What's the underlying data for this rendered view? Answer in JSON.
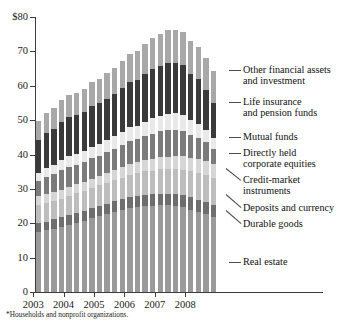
{
  "chart_data": {
    "type": "bar",
    "stacked": true,
    "title": "",
    "subtitle": "",
    "xlabel": "",
    "ylabel": "",
    "ylim": [
      0,
      80
    ],
    "yticks": [
      "$80",
      "70",
      "60",
      "50",
      "40",
      "30",
      "20",
      "10",
      "0"
    ],
    "ytick_values": [
      80,
      70,
      60,
      50,
      40,
      30,
      20,
      10,
      0
    ],
    "grid": false,
    "legend_position": "right-leader-lines",
    "xticks": [
      "2003",
      "2004",
      "2005",
      "2006",
      "2007",
      "2008"
    ],
    "xtick_values": [
      2003,
      2004,
      2005,
      2006,
      2007,
      2008
    ],
    "categories": [
      "2003:Q1",
      "2003:Q2",
      "2003:Q3",
      "2003:Q4",
      "2004:Q1",
      "2004:Q2",
      "2004:Q3",
      "2004:Q4",
      "2005:Q1",
      "2005:Q2",
      "2005:Q3",
      "2005:Q4",
      "2006:Q1",
      "2006:Q2",
      "2006:Q3",
      "2006:Q4",
      "2007:Q1",
      "2007:Q2",
      "2007:Q3",
      "2007:Q4",
      "2008:Q1",
      "2008:Q2",
      "2008:Q3",
      "2008:Q4"
    ],
    "series": [
      {
        "name": "Real estate",
        "color": "#9a9a9a",
        "values": [
          17.4,
          17.9,
          18.4,
          19.0,
          19.6,
          20.2,
          20.8,
          21.4,
          22.0,
          22.7,
          23.3,
          23.9,
          24.4,
          24.8,
          25.0,
          25.1,
          25.2,
          25.2,
          25.0,
          24.6,
          24.0,
          23.3,
          22.6,
          21.8
        ]
      },
      {
        "name": "Durable goods",
        "color": "#6e6e6e",
        "values": [
          2.6,
          2.6,
          2.7,
          2.7,
          2.8,
          2.8,
          2.9,
          2.9,
          3.0,
          3.0,
          3.1,
          3.1,
          3.2,
          3.2,
          3.3,
          3.3,
          3.4,
          3.4,
          3.5,
          3.5,
          3.5,
          3.5,
          3.5,
          3.4
        ]
      },
      {
        "name": "Deposits and currency",
        "color": "#bdbdbd",
        "values": [
          5.3,
          5.4,
          5.4,
          5.5,
          5.6,
          5.7,
          5.8,
          5.9,
          6.0,
          6.1,
          6.2,
          6.3,
          6.5,
          6.6,
          6.8,
          6.9,
          7.1,
          7.2,
          7.4,
          7.5,
          7.6,
          7.7,
          7.8,
          7.9
        ]
      },
      {
        "name": "Credit-market instruments",
        "color": "#d6d6d6",
        "values": [
          2.6,
          2.6,
          2.6,
          2.6,
          2.6,
          2.6,
          2.6,
          2.7,
          2.7,
          2.8,
          2.9,
          3.0,
          3.1,
          3.2,
          3.3,
          3.4,
          3.5,
          3.6,
          3.7,
          3.9,
          4.0,
          4.1,
          4.2,
          4.2
        ]
      },
      {
        "name": "Directly held corporate equities",
        "color": "#7b7b7b",
        "values": [
          4.4,
          4.9,
          5.1,
          5.6,
          5.7,
          5.6,
          5.6,
          6.0,
          5.9,
          6.0,
          6.2,
          6.4,
          6.7,
          6.6,
          7.0,
          7.4,
          7.5,
          7.7,
          7.6,
          7.4,
          6.6,
          6.3,
          5.4,
          4.4
        ]
      },
      {
        "name": "Mutual funds",
        "color": "#e9e9e9",
        "values": [
          2.4,
          2.7,
          2.8,
          3.1,
          3.2,
          3.2,
          3.2,
          3.4,
          3.4,
          3.5,
          3.6,
          3.8,
          4.0,
          4.0,
          4.2,
          4.5,
          4.6,
          4.8,
          4.8,
          4.7,
          4.3,
          4.1,
          3.6,
          3.0
        ]
      },
      {
        "name": "Life insurance and pension funds",
        "color": "#3a3a3a",
        "values": [
          9.4,
          10.2,
          10.4,
          11.1,
          11.3,
          11.3,
          11.4,
          11.9,
          11.9,
          12.1,
          12.4,
          12.8,
          13.2,
          13.3,
          13.8,
          14.3,
          14.5,
          14.8,
          14.7,
          14.4,
          13.4,
          12.9,
          11.7,
          10.4
        ]
      },
      {
        "name": "Other financial assets and investment",
        "color": "#a8a8a8",
        "values": [
          5.6,
          5.8,
          6.0,
          6.2,
          6.4,
          6.6,
          6.8,
          7.0,
          7.2,
          7.4,
          7.6,
          7.9,
          8.2,
          8.4,
          8.7,
          9.0,
          9.2,
          9.4,
          9.6,
          9.7,
          9.6,
          9.5,
          9.3,
          9.1
        ]
      }
    ],
    "totals": [
      49.7,
      52.1,
      53.4,
      55.8,
      57.2,
      58.0,
      59.1,
      61.2,
      62.1,
      63.6,
      65.3,
      67.2,
      69.3,
      70.1,
      72.1,
      73.9,
      75.0,
      76.1,
      76.3,
      75.7,
      73.0,
      71.4,
      68.1,
      64.2
    ]
  },
  "legend": {
    "items": [
      {
        "label_line1": "Other financial assets",
        "label_line2": "and investment"
      },
      {
        "label_line1": "Life insurance",
        "label_line2": "and pension funds"
      },
      {
        "label_line1": "Mutual funds",
        "label_line2": ""
      },
      {
        "label_line1": "Directly held",
        "label_line2": "corporate equities"
      },
      {
        "label_line1": "Credit-market",
        "label_line2": "instruments"
      },
      {
        "label_line1": "Deposits and currency",
        "label_line2": ""
      },
      {
        "label_line1": "Durable goods",
        "label_line2": ""
      },
      {
        "label_line1": "Real estate",
        "label_line2": ""
      }
    ]
  },
  "footnote": "*Households and nonprofit organizations."
}
